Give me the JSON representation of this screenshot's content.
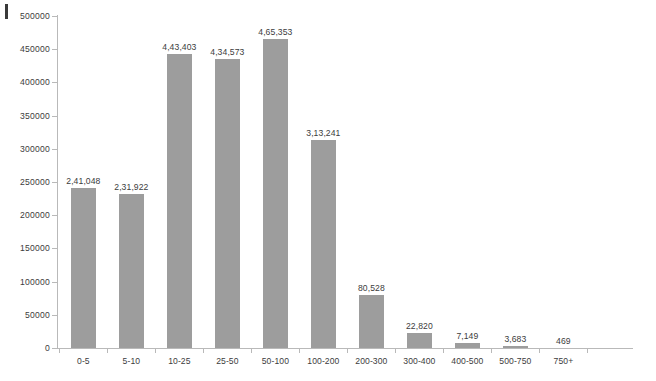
{
  "chart_data": {
    "type": "bar",
    "title": "",
    "subtitle": "",
    "xlabel": "",
    "ylabel": "",
    "ylim": [
      0,
      500000
    ],
    "ytick_values": [
      0,
      50000,
      100000,
      150000,
      200000,
      250000,
      300000,
      350000,
      400000,
      450000,
      500000
    ],
    "ytick_labels": [
      "0",
      "50000",
      "100000",
      "150000",
      "200000",
      "250000",
      "300000",
      "350000",
      "400000",
      "450000",
      "500000"
    ],
    "grid": false,
    "legend": null,
    "bar_color": "#9d9d9d",
    "axis_color": "#b9b9b9",
    "text_color": "#3c3c3c",
    "categories": [
      "0-5",
      "5-10",
      "10-25",
      "25-50",
      "50-100",
      "100-200",
      "200-300",
      "300-400",
      "400-500",
      "500-750",
      "750+"
    ],
    "values": [
      241048,
      231922,
      443403,
      434573,
      465353,
      313241,
      80528,
      22820,
      7149,
      3683,
      469
    ],
    "data_labels": [
      "2,41,048",
      "2,31,922",
      "4,43,403",
      "4,34,573",
      "4,65,353",
      "3,13,241",
      "80,528",
      "22,820",
      "7,149",
      "3,683",
      "469"
    ]
  }
}
